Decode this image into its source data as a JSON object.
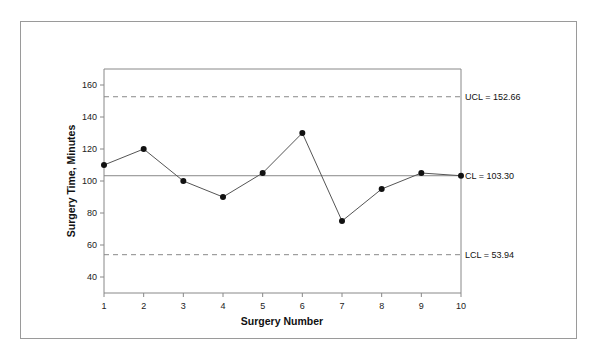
{
  "chart_data": {
    "type": "line",
    "title": "",
    "xlabel": "Surgery Number",
    "ylabel": "Surgery Time, Minutes",
    "x": [
      1,
      2,
      3,
      4,
      5,
      6,
      7,
      8,
      9,
      10
    ],
    "series": [
      {
        "name": "Surgery Time",
        "values": [
          110,
          120,
          100,
          90,
          105,
          130,
          75,
          95,
          105,
          103.3
        ]
      }
    ],
    "xlim": [
      1,
      10
    ],
    "ylim": [
      30,
      170
    ],
    "x_ticks": [
      "1",
      "2",
      "3",
      "4",
      "5",
      "6",
      "7",
      "8",
      "9",
      "10"
    ],
    "y_ticks": [
      "40",
      "60",
      "80",
      "100",
      "120",
      "140",
      "160"
    ],
    "grid": false,
    "legend": "none",
    "control_limits": [
      {
        "name": "UCL",
        "value": 152.66,
        "label": "UCL = 152.66",
        "style": "dashed"
      },
      {
        "name": "CL",
        "value": 103.3,
        "label": "CL = 103.30",
        "style": "solid"
      },
      {
        "name": "LCL",
        "value": 53.94,
        "label": "LCL = 53.94",
        "style": "dashed"
      }
    ]
  },
  "colors": {
    "line": "#555555",
    "marker": "#111111",
    "axis": "#888888",
    "limit_line": "#888888",
    "frame": "#9a9a9a"
  }
}
